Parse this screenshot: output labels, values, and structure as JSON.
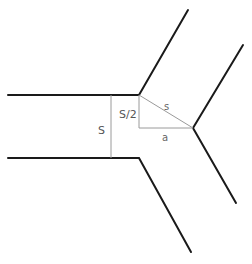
{
  "diagram": {
    "labels": {
      "S": "S",
      "S_half": "S/2",
      "s": "s",
      "a": "a"
    },
    "colors": {
      "wall": "#1a1a1a",
      "construction": "#9a9a9a",
      "text": "#555555"
    }
  }
}
